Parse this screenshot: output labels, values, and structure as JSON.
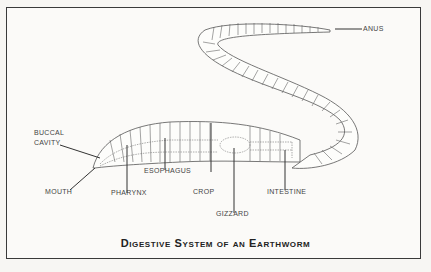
{
  "figure": {
    "title": "Digestive System of an Earthworm",
    "labels": {
      "buccal_cavity_line1": "BUCCAL",
      "buccal_cavity_line2": "CAVITY",
      "mouth": "MOUTH",
      "pharynx": "PHARYNX",
      "esophagus": "ESOPHAGUS",
      "crop": "CROP",
      "gizzard": "GIZZARD",
      "intestine": "INTESTINE",
      "anus": "ANUS"
    }
  }
}
